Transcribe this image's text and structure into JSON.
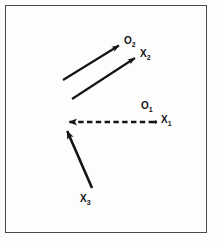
{
  "figure": {
    "type": "vector-diagram",
    "background_color": "#fdfdfd",
    "frame_color": "#4a4a4a",
    "stroke_color": "#141414",
    "labels": {
      "o2": {
        "base": "O",
        "sub": "2"
      },
      "x2": {
        "base": "X",
        "sub": "2"
      },
      "o1": {
        "base": "O",
        "sub": "1"
      },
      "x1": {
        "base": "X",
        "sub": "1"
      },
      "x3": {
        "base": "X",
        "sub": "3"
      }
    },
    "vectors": [
      {
        "name": "o2-vector",
        "label": "O2",
        "style": "solid",
        "from": [
          63,
          80
        ],
        "to": [
          122,
          43
        ]
      },
      {
        "name": "x2-vector",
        "label": "X2",
        "style": "solid",
        "from": [
          72,
          99
        ],
        "to": [
          138,
          56
        ]
      },
      {
        "name": "x1-vector",
        "label": "X1",
        "style": "dashed",
        "from": [
          155,
          122
        ],
        "to": [
          64,
          122
        ]
      },
      {
        "name": "x3-vector",
        "label": "X3",
        "style": "solid",
        "from": [
          92,
          188
        ],
        "to": [
          64,
          124
        ]
      }
    ],
    "points": [
      {
        "name": "x1-point",
        "at": [
          155,
          122
        ]
      }
    ]
  }
}
